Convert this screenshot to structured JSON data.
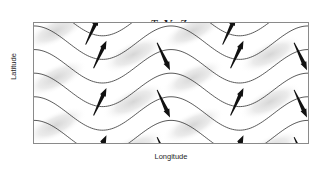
{
  "figure": {
    "title_parts": [
      {
        "text": "T",
        "style": "italic"
      },
      {
        "text": ", ",
        "style": "roman"
      },
      {
        "text": "V",
        "style": "bold"
      },
      {
        "text": ", ",
        "style": "roman"
      },
      {
        "text": "Z",
        "style": "italic"
      }
    ],
    "title_plain": "T, V, Z",
    "xlabel": "Longitude",
    "ylabel": "Latitude"
  },
  "chart_data": {
    "type": "line",
    "title": "T, V, Z",
    "xlabel": "Longitude",
    "ylabel": "Latitude",
    "xlim": [
      0,
      276
    ],
    "ylim": [
      0,
      122
    ],
    "grid": false,
    "legend": "none",
    "axis_ticks": {
      "x": [],
      "y": []
    },
    "colors": {
      "contour_line": "#3a3a3a",
      "arrow": "#111111",
      "shading_warm": "#dedede",
      "frame": "#8a8a8a",
      "background": "#ffffff",
      "text": "#1f1f1f"
    },
    "series": [
      {
        "name": "Z-contour-1",
        "kind": "sinusoid",
        "amplitude": 17,
        "wavelength": 138,
        "phase_deg": 0,
        "baseline_y": -4
      },
      {
        "name": "Z-contour-2",
        "kind": "sinusoid",
        "amplitude": 17,
        "wavelength": 138,
        "phase_deg": 0,
        "baseline_y": 20
      },
      {
        "name": "Z-contour-3",
        "kind": "sinusoid",
        "amplitude": 17,
        "wavelength": 138,
        "phase_deg": 0,
        "baseline_y": 44
      },
      {
        "name": "Z-contour-4",
        "kind": "sinusoid",
        "amplitude": 17,
        "wavelength": 138,
        "phase_deg": 0,
        "baseline_y": 68
      },
      {
        "name": "Z-contour-5",
        "kind": "sinusoid",
        "amplitude": 17,
        "wavelength": 138,
        "phase_deg": 0,
        "baseline_y": 92
      },
      {
        "name": "Z-contour-6",
        "kind": "sinusoid",
        "amplitude": 17,
        "wavelength": 138,
        "phase_deg": 0,
        "baseline_y": 116
      },
      {
        "name": "Z-contour-7",
        "kind": "sinusoid",
        "amplitude": 17,
        "wavelength": 138,
        "phase_deg": 0,
        "baseline_y": 140
      }
    ],
    "wind_vectors": [
      {
        "x": 60,
        "y": 46,
        "dx": 13,
        "dy": -28,
        "direction": "up-right"
      },
      {
        "x": 60,
        "y": 94,
        "dx": 13,
        "dy": -28,
        "direction": "up-right"
      },
      {
        "x": 60,
        "y": 142,
        "dx": 13,
        "dy": -28,
        "direction": "up-right"
      },
      {
        "x": 52,
        "y": 22,
        "dx": 13,
        "dy": -28,
        "direction": "up-right"
      },
      {
        "x": 124,
        "y": 20,
        "dx": 13,
        "dy": 28,
        "direction": "down-right"
      },
      {
        "x": 124,
        "y": 68,
        "dx": 13,
        "dy": 28,
        "direction": "down-right"
      },
      {
        "x": 124,
        "y": 116,
        "dx": 13,
        "dy": 28,
        "direction": "down-right"
      },
      {
        "x": 198,
        "y": 46,
        "dx": 13,
        "dy": -28,
        "direction": "up-right"
      },
      {
        "x": 198,
        "y": 94,
        "dx": 13,
        "dy": -28,
        "direction": "up-right"
      },
      {
        "x": 198,
        "y": 142,
        "dx": 13,
        "dy": -28,
        "direction": "up-right"
      },
      {
        "x": 190,
        "y": 22,
        "dx": 13,
        "dy": -28,
        "direction": "up-right"
      },
      {
        "x": 262,
        "y": 20,
        "dx": 13,
        "dy": 28,
        "direction": "down-right"
      },
      {
        "x": 262,
        "y": 68,
        "dx": 13,
        "dy": 28,
        "direction": "down-right"
      },
      {
        "x": 262,
        "y": 116,
        "dx": 13,
        "dy": 28,
        "direction": "down-right"
      }
    ],
    "temperature_patches": [
      {
        "cx": 22,
        "cy": 8,
        "rx": 34,
        "ry": 13,
        "level": "warm"
      },
      {
        "cx": 22,
        "cy": 56,
        "rx": 34,
        "ry": 13,
        "level": "warm"
      },
      {
        "cx": 22,
        "cy": 104,
        "rx": 34,
        "ry": 13,
        "level": "warm"
      },
      {
        "cx": 100,
        "cy": 32,
        "rx": 34,
        "ry": 13,
        "level": "warm"
      },
      {
        "cx": 100,
        "cy": 80,
        "rx": 34,
        "ry": 13,
        "level": "warm"
      },
      {
        "cx": 100,
        "cy": 128,
        "rx": 34,
        "ry": 13,
        "level": "warm"
      },
      {
        "cx": 160,
        "cy": 8,
        "rx": 34,
        "ry": 13,
        "level": "warm"
      },
      {
        "cx": 160,
        "cy": 56,
        "rx": 34,
        "ry": 13,
        "level": "warm"
      },
      {
        "cx": 160,
        "cy": 104,
        "rx": 34,
        "ry": 13,
        "level": "warm"
      },
      {
        "cx": 238,
        "cy": 32,
        "rx": 34,
        "ry": 13,
        "level": "warm"
      },
      {
        "cx": 238,
        "cy": 80,
        "rx": 34,
        "ry": 13,
        "level": "warm"
      },
      {
        "cx": 238,
        "cy": 128,
        "rx": 34,
        "ry": 13,
        "level": "warm"
      }
    ]
  }
}
